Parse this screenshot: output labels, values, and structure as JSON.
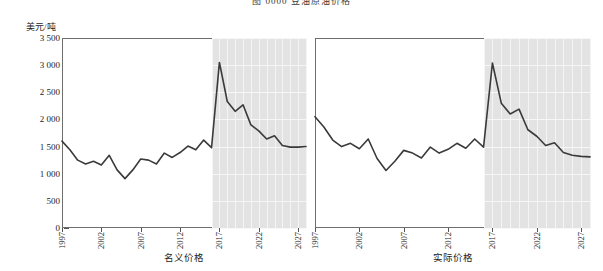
{
  "figure": {
    "clipped_title": "图 0000   豆油原油价格",
    "y_axis_label": "美元/吨",
    "y_ticks": [
      "3 500",
      "3 000",
      "2 500",
      "2 000",
      "1 500",
      "1 000",
      "500",
      "0"
    ]
  },
  "panels": [
    {
      "caption": "名义价格"
    },
    {
      "caption": "实际价格"
    }
  ],
  "chart_data": {
    "type": "line",
    "title": "图 0000   豆油原油价格",
    "xlabel": "",
    "ylabel": "美元/吨",
    "ylim": [
      0,
      3500
    ],
    "ytick_values": [
      0,
      500,
      1000,
      1500,
      2000,
      2500,
      3000,
      3500
    ],
    "ytick_labels": [
      "0",
      "500",
      "1 000",
      "1 500",
      "2 000",
      "2 500",
      "3 000",
      "3 500"
    ],
    "xlim": [
      1997,
      2028
    ],
    "xtick_values": [
      1997,
      2002,
      2007,
      2012,
      2017,
      2022,
      2027
    ],
    "xtick_labels": [
      "1997",
      "2002",
      "2007",
      "2012",
      "2017",
      "2022",
      "2027"
    ],
    "grid": false,
    "legend": "none",
    "forecast_start_year": 2016,
    "forecast_shading_color": "#e3e3e3",
    "line_color": "#3a3a3a",
    "panels": [
      {
        "name": "nominal",
        "caption": "名义价格",
        "x": [
          1997,
          1998,
          1999,
          2000,
          2001,
          2002,
          2003,
          2004,
          2005,
          2006,
          2007,
          2008,
          2009,
          2010,
          2011,
          2012,
          2013,
          2014,
          2015,
          2016,
          2017,
          2018,
          2019,
          2020,
          2021,
          2022,
          2023,
          2024,
          2025,
          2026,
          2027,
          2028
        ],
        "values": [
          1600,
          1440,
          1250,
          1180,
          1230,
          1160,
          1340,
          1070,
          910,
          1070,
          1270,
          1250,
          1180,
          1380,
          1300,
          1390,
          1510,
          1440,
          1620,
          1480,
          3050,
          2330,
          2150,
          2270,
          1900,
          1790,
          1640,
          1700,
          1520,
          1490,
          1490,
          1500
        ],
        "note": "historical through 2015, forecast (shaded) 2016 onward"
      },
      {
        "name": "real",
        "caption": "实际价格",
        "x": [
          1997,
          1998,
          1999,
          2000,
          2001,
          2002,
          2003,
          2004,
          2005,
          2006,
          2007,
          2008,
          2009,
          2010,
          2011,
          2012,
          2013,
          2014,
          2015,
          2016,
          2017,
          2018,
          2019,
          2020,
          2021,
          2022,
          2023,
          2024,
          2025,
          2026,
          2027,
          2028
        ],
        "values": [
          2050,
          1860,
          1620,
          1500,
          1560,
          1460,
          1640,
          1280,
          1060,
          1230,
          1430,
          1380,
          1290,
          1490,
          1380,
          1450,
          1560,
          1470,
          1640,
          1490,
          3040,
          2300,
          2100,
          2190,
          1810,
          1690,
          1520,
          1570,
          1390,
          1340,
          1320,
          1310
        ],
        "note": "historical through 2015, forecast (shaded) 2016 onward"
      }
    ]
  }
}
